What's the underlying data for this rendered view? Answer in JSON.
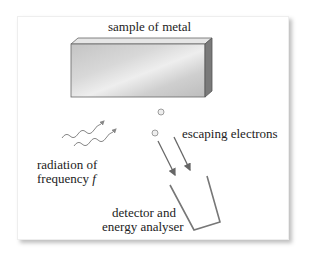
{
  "diagram": {
    "labels": {
      "metal": "sample of metal",
      "electrons": "escaping electrons",
      "radiation_line1": "radiation of",
      "radiation_line2": "frequency",
      "radiation_symbol": "f",
      "detector_line1": "detector and",
      "detector_line2": "energy analyser"
    },
    "colors": {
      "arrow": "#666666",
      "metal_front": "#cfcfcf",
      "metal_side": "#7a7a7a",
      "wave": "#888888"
    }
  }
}
